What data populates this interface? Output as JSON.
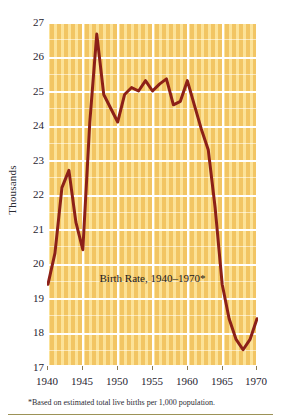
{
  "axis": {
    "ylabel": "Thousands",
    "yticks": [
      "27",
      "26",
      "25",
      "24",
      "23",
      "22",
      "21",
      "20",
      "19",
      "18",
      "17"
    ],
    "xticks": [
      "1940",
      "1945",
      "1950",
      "1955",
      "1960",
      "1965",
      "1970"
    ]
  },
  "title": "Birth Rate, 1940–1970*",
  "footnote": "*Based on estimated total live births per 1,000 population.",
  "colors": {
    "plot_background": "#f2c563",
    "stripe": "#ffecaa",
    "gridline": "#ffffff",
    "line": "#8c2018",
    "text": "#1f2430",
    "rule": "#9c9257"
  },
  "chart_data": {
    "type": "line",
    "title": "Birth Rate, 1940–1970*",
    "xlabel": "",
    "ylabel": "Thousands",
    "xlim": [
      1940,
      1970
    ],
    "ylim": [
      17,
      27
    ],
    "grid": true,
    "legend": null,
    "annotations": [
      "*Based on estimated total live births per 1,000 population."
    ],
    "x": [
      1940,
      1941,
      1942,
      1943,
      1944,
      1945,
      1946,
      1947,
      1948,
      1949,
      1950,
      1951,
      1952,
      1953,
      1954,
      1955,
      1956,
      1957,
      1958,
      1959,
      1960,
      1961,
      1962,
      1963,
      1964,
      1965,
      1966,
      1967,
      1968,
      1969,
      1970
    ],
    "series": [
      {
        "name": "Birth Rate",
        "values": [
          19.4,
          20.3,
          22.2,
          22.7,
          21.2,
          20.4,
          24.1,
          26.65,
          24.9,
          24.5,
          24.1,
          24.9,
          25.1,
          25.0,
          25.3,
          25.0,
          25.2,
          25.35,
          24.6,
          24.7,
          25.3,
          24.6,
          23.9,
          23.3,
          21.6,
          19.4,
          18.4,
          17.8,
          17.5,
          17.8,
          18.4
        ],
        "color": "#8c2018"
      }
    ]
  }
}
